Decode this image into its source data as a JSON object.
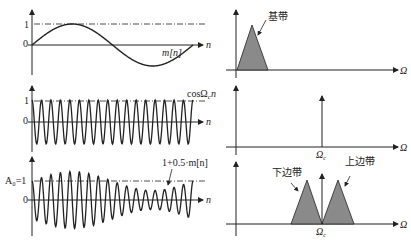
{
  "left_panels": {
    "baseband": {
      "y_tick_1": "1",
      "y_tick_0": "0",
      "x_label": "n",
      "signal_label": "m[n]"
    },
    "carrier": {
      "y_tick_1": "1",
      "y_tick_0": "0",
      "x_label": "n",
      "signal_label": "cosΩ",
      "signal_sub": "c",
      "signal_suffix": "n"
    },
    "modulated": {
      "y_tick_1": "A₀=1",
      "y_tick_0": "0",
      "x_label": "n",
      "envelope_label": "1+0.5·m[n]"
    }
  },
  "right_panels": {
    "baseband_spectrum": {
      "x_label": "Ω",
      "band_label": "基带"
    },
    "carrier_spectrum": {
      "x_label": "Ω",
      "freq_label": "Ω",
      "freq_sub": "c"
    },
    "modulated_spectrum": {
      "x_label": "Ω",
      "lower_label": "下边带",
      "upper_label": "上边带",
      "freq_label": "Ω",
      "freq_sub": "c"
    }
  },
  "colors": {
    "line": "#222222",
    "fill": "#8a8a8a"
  }
}
